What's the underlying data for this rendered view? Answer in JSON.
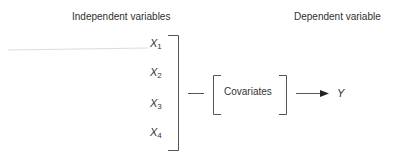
{
  "headings": {
    "independent": "Independent variables",
    "dependent": "Dependent variable"
  },
  "independent_variables": [
    {
      "symbol": "X",
      "subscript": "1"
    },
    {
      "symbol": "X",
      "subscript": "2"
    },
    {
      "symbol": "X",
      "subscript": "3"
    },
    {
      "symbol": "X",
      "subscript": "4"
    }
  ],
  "covariates": {
    "label": "Covariates"
  },
  "dependent_variable": {
    "symbol": "Y"
  },
  "colors": {
    "line": "#555555",
    "text": "#2f2f2f",
    "faint_line": "#dcdcdc"
  }
}
